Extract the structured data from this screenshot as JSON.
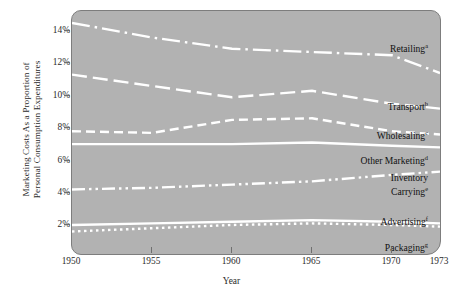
{
  "chart_data": {
    "type": "line",
    "title": "",
    "xlabel": "Year",
    "ylabel": "Marketing Costs As a Proportion of Personal Consumption Expenditures",
    "ylabel_line1": "Marketing Costs As a Proportion of",
    "ylabel_line2": "Personal Consumption Expenditures",
    "x": [
      1950,
      1955,
      1960,
      1965,
      1970,
      1973
    ],
    "xlim": [
      1950,
      1973
    ],
    "ylim": [
      0,
      15.2
    ],
    "grid": false,
    "legend_position": "inline-right",
    "xticklabels": [
      "1950",
      "1955",
      "1960",
      "1965",
      "1970",
      "1973"
    ],
    "yticklabels": [
      "2%",
      "4%",
      "6%",
      "8%",
      "10%",
      "12%",
      "14%"
    ],
    "ytickvalues": [
      2,
      4,
      6,
      8,
      10,
      12,
      14
    ],
    "series": [
      {
        "name": "Retailing",
        "superscript": "a",
        "label": "Retailing",
        "style": "dash-dot",
        "values": [
          14.5,
          13.6,
          12.9,
          12.7,
          12.5,
          11.4
        ]
      },
      {
        "name": "Transport",
        "superscript": "b",
        "label": "Transport",
        "style": "long-dash",
        "values": [
          11.3,
          10.6,
          9.9,
          10.3,
          9.5,
          9.2
        ]
      },
      {
        "name": "Wholesaling",
        "superscript": "c",
        "label": "Wholesaling",
        "style": "dash",
        "values": [
          7.8,
          7.7,
          8.5,
          8.6,
          7.8,
          7.6
        ]
      },
      {
        "name": "Other Marketing",
        "superscript": "d",
        "label": "Other Marketing",
        "style": "solid",
        "values": [
          7.0,
          7.0,
          7.0,
          7.1,
          6.9,
          6.8
        ]
      },
      {
        "name": "Inventory Carrying",
        "superscript": "e",
        "label_line1": "Inventory",
        "label_line2": "Carrying",
        "style": "dash-dot-dot",
        "values": [
          4.2,
          4.3,
          4.5,
          4.7,
          5.1,
          5.3
        ]
      },
      {
        "name": "Advertising",
        "superscript": "f",
        "label": "Advertising",
        "style": "solid",
        "values": [
          2.0,
          2.1,
          2.2,
          2.3,
          2.2,
          2.1
        ]
      },
      {
        "name": "Packaging",
        "superscript": "g",
        "label": "Packaging",
        "style": "dotted",
        "values": [
          1.6,
          1.8,
          2.0,
          2.1,
          2.0,
          1.9
        ]
      }
    ],
    "colors": {
      "panel_background": "#b2b2b2",
      "line": "#ffffff",
      "text": "#1a1a1a",
      "axis": "#6f6f6f",
      "page_background": "#ffffff"
    }
  }
}
